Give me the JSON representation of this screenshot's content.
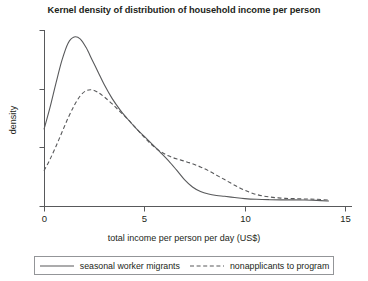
{
  "chart_data": {
    "type": "line",
    "title": "Kernel density of distribution of household income per person",
    "xlabel": "total income per person per day (US$)",
    "ylabel": "density",
    "xlim": [
      0,
      15
    ],
    "ylim": [
      0,
      1
    ],
    "xticks": [
      0,
      5,
      10,
      15
    ],
    "xticklabels": [
      "0",
      "5",
      "10",
      "15"
    ],
    "yticks": [
      0,
      0.333,
      0.667,
      1.0
    ],
    "yticklabels": [
      "",
      "",
      "",
      ""
    ],
    "grid": false,
    "legend_position": "below-axes",
    "series": [
      {
        "name": "seasonal worker migrants",
        "style": "solid",
        "color": "#58595b",
        "x": [
          0.0,
          0.3,
          0.6,
          0.9,
          1.2,
          1.5,
          1.8,
          2.1,
          2.4,
          2.7,
          3.0,
          3.4,
          3.8,
          4.2,
          4.6,
          5.0,
          5.4,
          5.8,
          6.2,
          6.6,
          7.0,
          7.4,
          7.8,
          8.2,
          8.6,
          9.0,
          9.5,
          10.0,
          10.6,
          11.2,
          11.8,
          12.4,
          13.0,
          13.6,
          14.2
        ],
        "y": [
          0.435,
          0.56,
          0.7,
          0.83,
          0.925,
          0.96,
          0.95,
          0.9,
          0.83,
          0.76,
          0.69,
          0.61,
          0.545,
          0.49,
          0.44,
          0.395,
          0.35,
          0.305,
          0.258,
          0.205,
          0.15,
          0.108,
          0.082,
          0.068,
          0.06,
          0.055,
          0.048,
          0.042,
          0.038,
          0.036,
          0.035,
          0.035,
          0.034,
          0.032,
          0.028
        ]
      },
      {
        "name": "nonapplicants to program",
        "style": "dashed",
        "color": "#58595b",
        "x": [
          0.0,
          0.3,
          0.6,
          0.9,
          1.2,
          1.5,
          1.8,
          2.1,
          2.4,
          2.7,
          3.0,
          3.4,
          3.8,
          4.2,
          4.6,
          5.0,
          5.4,
          5.8,
          6.2,
          6.6,
          7.0,
          7.4,
          7.8,
          8.2,
          8.6,
          9.0,
          9.5,
          10.0,
          10.6,
          11.2,
          11.8,
          12.4,
          13.0,
          13.6,
          14.2
        ],
        "y": [
          0.2,
          0.265,
          0.34,
          0.42,
          0.5,
          0.57,
          0.625,
          0.655,
          0.66,
          0.645,
          0.62,
          0.58,
          0.535,
          0.49,
          0.44,
          0.39,
          0.345,
          0.31,
          0.285,
          0.268,
          0.255,
          0.24,
          0.222,
          0.2,
          0.175,
          0.15,
          0.118,
          0.09,
          0.065,
          0.052,
          0.045,
          0.042,
          0.04,
          0.038,
          0.034
        ]
      }
    ]
  },
  "legend": {
    "entries": [
      {
        "label": "seasonal worker migrants",
        "style": "solid"
      },
      {
        "label": "nonapplicants to program",
        "style": "dashed"
      }
    ]
  }
}
